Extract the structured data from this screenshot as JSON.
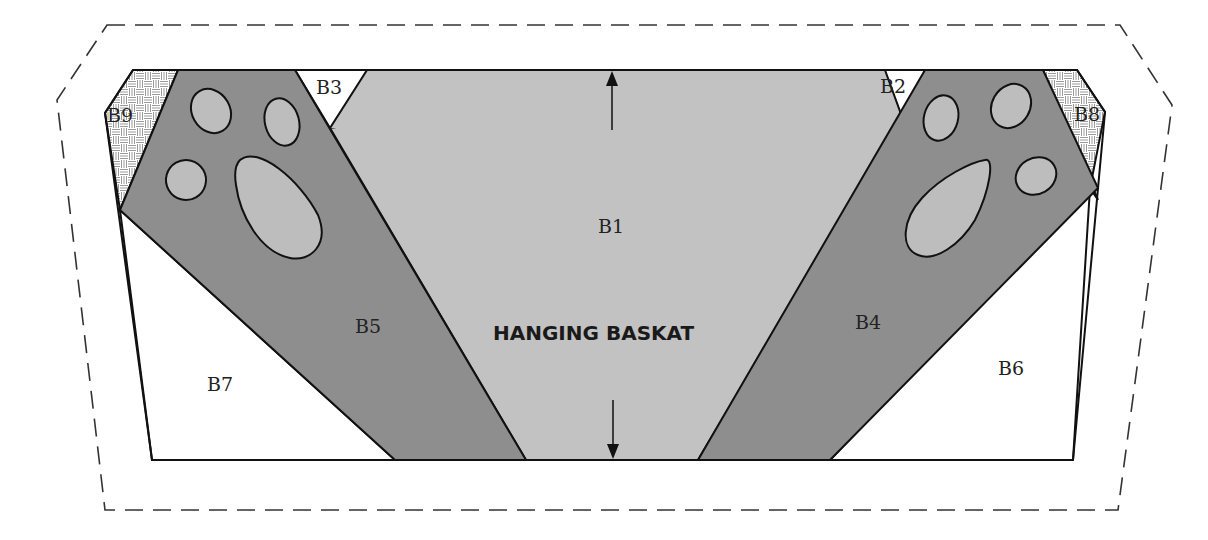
{
  "diagram": {
    "title": "HANGING BASKAT",
    "seam_allowance": "dashed",
    "pieces": [
      {
        "id": "B1",
        "label": "B1",
        "fill": "light-gray",
        "role": "basket body"
      },
      {
        "id": "B2",
        "label": "B2",
        "fill": "white"
      },
      {
        "id": "B3",
        "label": "B3",
        "fill": "white"
      },
      {
        "id": "B4",
        "label": "B4",
        "fill": "dark-gray",
        "role": "right paw strip"
      },
      {
        "id": "B5",
        "label": "B5",
        "fill": "dark-gray",
        "role": "left paw strip"
      },
      {
        "id": "B6",
        "label": "B6",
        "fill": "white"
      },
      {
        "id": "B7",
        "label": "B7",
        "fill": "white"
      },
      {
        "id": "B8",
        "label": "B8",
        "fill": "basketweave-pattern"
      },
      {
        "id": "B9",
        "label": "B9",
        "fill": "basketweave-pattern"
      }
    ],
    "grain_arrows": "vertical double-headed",
    "colors": {
      "light": "#c2c2c2",
      "dark": "#8e8e8e",
      "pad": "#bdbdbd",
      "white": "#ffffff",
      "line": "#111111"
    }
  }
}
